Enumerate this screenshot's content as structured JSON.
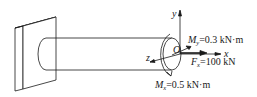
{
  "diagram": {
    "type": "cantilever-beam-loading",
    "axes": {
      "x": "x",
      "y": "y",
      "z": "z",
      "origin": "O"
    },
    "loads": {
      "My": {
        "symbol": "M",
        "subscript": "y",
        "value": "=0.3 kN·m"
      },
      "Fx": {
        "symbol": "F",
        "subscript": "x",
        "value": "=100 kN"
      },
      "Mx": {
        "symbol": "M",
        "subscript": "x",
        "value": "=0.5 kN·m"
      }
    },
    "colors": {
      "line": "#1a1a1a",
      "background": "#ffffff"
    }
  }
}
